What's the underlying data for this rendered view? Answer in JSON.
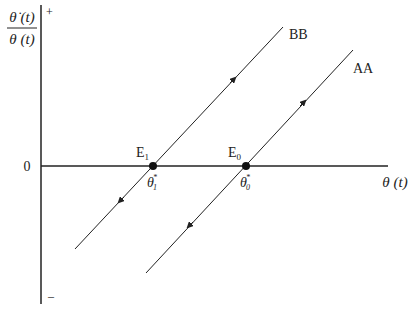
{
  "diagram": {
    "y_axis_label_numerator": "θ̇ (t)",
    "y_axis_label_denominator": "θ (t)",
    "y_plus": "+",
    "y_minus": "–",
    "origin_label": "0",
    "x_axis_label": "θ (t)",
    "lines": [
      {
        "name": "BB",
        "label": "BB",
        "direction": "unstable, arrows away from equilibrium"
      },
      {
        "name": "AA",
        "label": "AA",
        "direction": "unstable, arrows away from equilibrium"
      }
    ],
    "equilibria": [
      {
        "label": "E",
        "sub": "1",
        "theta_label": "θ",
        "theta_sub": "1",
        "theta_sup": "*"
      },
      {
        "label": "E",
        "sub": "0",
        "theta_label": "θ",
        "theta_sub": "0",
        "theta_sup": "*"
      }
    ],
    "colors": {
      "ink": "#222222"
    }
  }
}
